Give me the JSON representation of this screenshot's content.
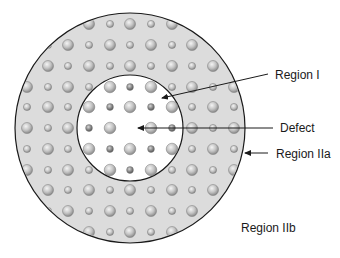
{
  "figure": {
    "width": 340,
    "height": 258,
    "colors": {
      "background": "#ffffff",
      "outer_fill": "#dcdcdc",
      "inner_fill": "#ffffff",
      "stroke": "#1a1a1a",
      "dot_light": "#e2e2e2",
      "dot_dark": "#8e8e8e",
      "dot_stroke": "#7a7a7a"
    },
    "outer_circle": {
      "cx": 130,
      "cy": 128,
      "r": 115
    },
    "inner_circle": {
      "cx": 130,
      "cy": 128,
      "r": 53
    },
    "lattice": {
      "x": [
        27,
        48,
        68,
        89,
        110,
        130,
        151,
        172,
        192,
        213,
        234
      ],
      "y": [
        24,
        45,
        66,
        87,
        107,
        128,
        149,
        170,
        190,
        211,
        232
      ],
      "large_r": 5.5,
      "small_r": 3.6,
      "inner_large_r": 5.8,
      "inner_small_r": 3.4,
      "defect": {
        "x": 130,
        "y": 128
      }
    }
  },
  "labels": {
    "region_i": "Region I",
    "defect": "Defect",
    "region_iia": "Region IIa",
    "region_iib": "Region IIb"
  },
  "arrows": [
    {
      "name": "region-i-arrow",
      "x1": 268,
      "y1": 74,
      "x2": 162,
      "y2": 98
    },
    {
      "name": "defect-arrow",
      "x1": 273,
      "y1": 128,
      "x2": 138,
      "y2": 128
    },
    {
      "name": "region-iia-arrow",
      "x1": 268,
      "y1": 153,
      "x2": 245,
      "y2": 153
    }
  ]
}
